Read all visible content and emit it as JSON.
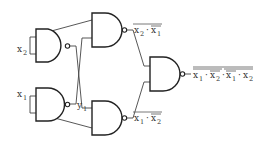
{
  "diagram": {
    "type": "logic-circuit",
    "gate_type": "NAND",
    "inputs": {
      "x2": {
        "label": "x",
        "sub": "2"
      },
      "x1": {
        "label": "x",
        "sub": "1"
      }
    },
    "intermediate": {
      "y1": {
        "label": "y",
        "sub": "1"
      }
    },
    "outputs": {
      "top": {
        "text": "x2 · x1",
        "overline_full": true,
        "overline_x1": true
      },
      "bottom": {
        "text": "x1 · x2",
        "overline_full": true,
        "overline_x2": true
      },
      "final": {
        "text": "x1 · x2 · x1 · x2"
      }
    },
    "labels": {
      "x2_main": "x",
      "x2_sub": "2",
      "x1_main": "x",
      "x1_sub": "1",
      "y1_main": "y",
      "y1_sub": "1",
      "top_out_a": "x",
      "top_out_a_sub": "2",
      "top_out_dot": "·",
      "top_out_b": "x",
      "top_out_b_sub": "1",
      "bot_out_a": "x",
      "bot_out_a_sub": "1",
      "bot_out_dot": "·",
      "bot_out_b": "x",
      "bot_out_b_sub": "2",
      "fin_a": "x",
      "fin_a_sub": "1",
      "fin_dot1": "·",
      "fin_b": "x",
      "fin_b_sub": "2",
      "fin_dot2": "·",
      "fin_c": "x",
      "fin_c_sub": "1",
      "fin_dot3": "·",
      "fin_d": "x",
      "fin_d_sub": "2"
    },
    "colors": {
      "stroke": "#222222",
      "wire": "#444444",
      "text": "#333333",
      "background": "#ffffff"
    }
  }
}
